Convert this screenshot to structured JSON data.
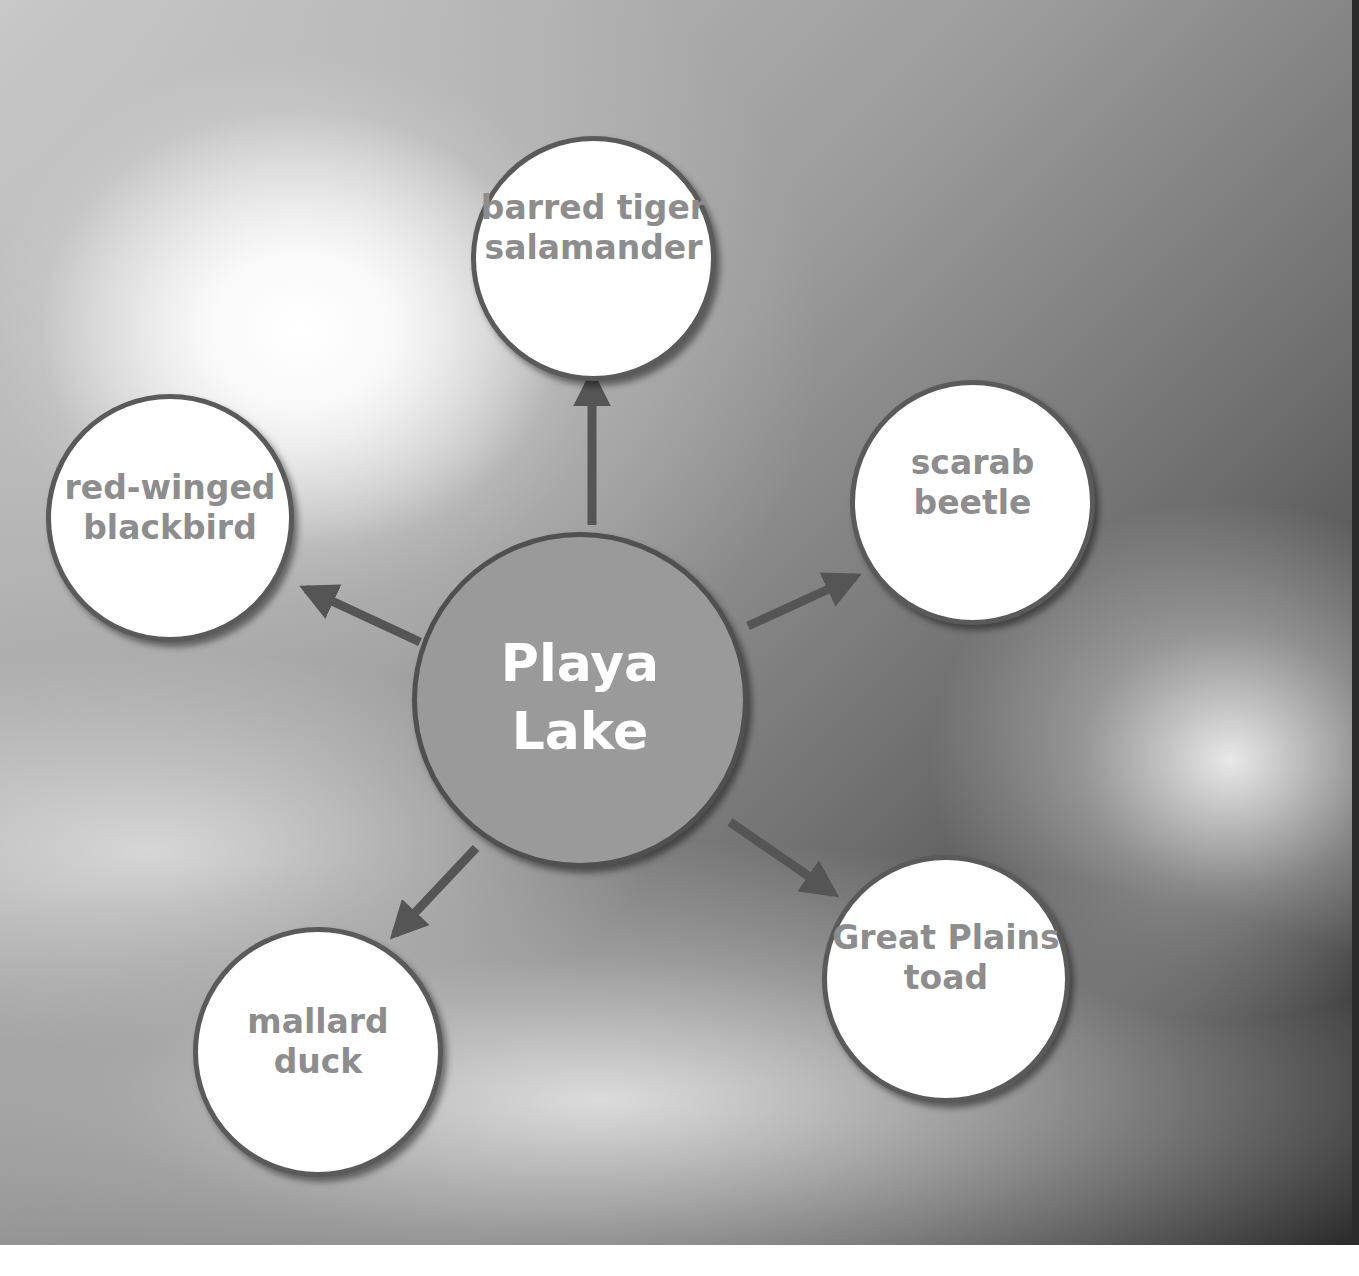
{
  "diagram": {
    "type": "concept-web",
    "center": {
      "label": "Playa\nLake",
      "fill": "#9a9a9a",
      "text_color": "#ffffff"
    },
    "nodes": [
      {
        "id": "top",
        "label": "barred tiger\nsalamander"
      },
      {
        "id": "right",
        "label": "scarab\nbeetle"
      },
      {
        "id": "bottom-right",
        "label": "Great Plains\ntoad"
      },
      {
        "id": "bottom-left",
        "label": "mallard\nduck"
      },
      {
        "id": "left",
        "label": "red-winged\nblackbird"
      }
    ],
    "edges": [
      {
        "from": "center",
        "to": "top"
      },
      {
        "from": "center",
        "to": "right"
      },
      {
        "from": "center",
        "to": "bottom-right"
      },
      {
        "from": "center",
        "to": "bottom-left"
      },
      {
        "from": "center",
        "to": "left"
      }
    ],
    "colors": {
      "arrow": "#555555",
      "node_border": "#5a5a5a",
      "node_text": "#8d8d8d",
      "node_fill": "#ffffff"
    },
    "background": "grayscale sky with sun and clouds"
  }
}
